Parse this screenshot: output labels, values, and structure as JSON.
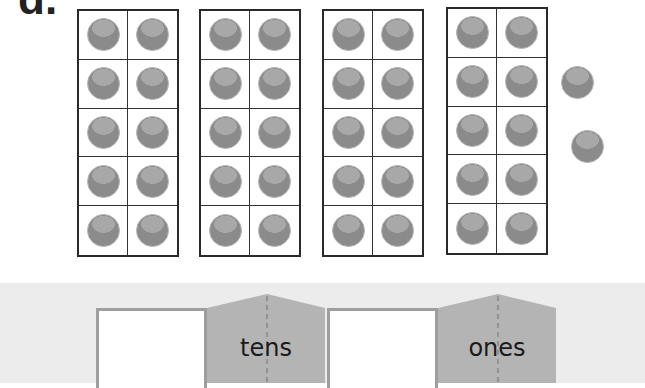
{
  "problem": {
    "label": "d."
  },
  "ten_frames": [
    {
      "filled": 10
    },
    {
      "filled": 10
    },
    {
      "filled": 10
    },
    {
      "filled": 10
    }
  ],
  "loose_counters": 2,
  "place_value_chart": {
    "tens": {
      "label": "tens",
      "value": ""
    },
    "ones": {
      "label": "ones",
      "value": ""
    }
  },
  "colors": {
    "counter": "#8b8b8b",
    "counter_highlight": "#a8a8a8",
    "frame_border": "#2a2a2a",
    "band": "#ececec",
    "tab": "#b4b4b4"
  }
}
